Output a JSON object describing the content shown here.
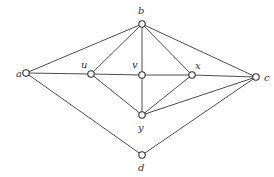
{
  "diagram": {
    "type": "graph",
    "nodes": [
      {
        "id": "a",
        "label": "a",
        "x": 26,
        "y": 73,
        "lx": 16,
        "ly": 77
      },
      {
        "id": "b",
        "label": "b",
        "x": 142,
        "y": 24,
        "lx": 138,
        "ly": 14
      },
      {
        "id": "u",
        "label": "u",
        "x": 91,
        "y": 74,
        "lx": 81,
        "ly": 68
      },
      {
        "id": "v",
        "label": "v",
        "x": 142,
        "y": 75,
        "lx": 132,
        "ly": 68
      },
      {
        "id": "x",
        "label": "x",
        "x": 192,
        "y": 75,
        "lx": 195,
        "ly": 69
      },
      {
        "id": "c",
        "label": "c",
        "x": 256,
        "y": 77,
        "lx": 264,
        "ly": 81
      },
      {
        "id": "y",
        "label": "y",
        "x": 142,
        "y": 115,
        "lx": 138,
        "ly": 131
      },
      {
        "id": "d",
        "label": "d",
        "x": 142,
        "y": 155,
        "lx": 138,
        "ly": 171
      }
    ],
    "edges": [
      [
        "a",
        "b"
      ],
      [
        "a",
        "u"
      ],
      [
        "a",
        "d"
      ],
      [
        "u",
        "b"
      ],
      [
        "u",
        "v"
      ],
      [
        "u",
        "y"
      ],
      [
        "v",
        "b"
      ],
      [
        "v",
        "x"
      ],
      [
        "v",
        "y"
      ],
      [
        "x",
        "b"
      ],
      [
        "x",
        "c"
      ],
      [
        "x",
        "y"
      ],
      [
        "b",
        "c"
      ],
      [
        "y",
        "c"
      ],
      [
        "d",
        "c"
      ]
    ]
  }
}
